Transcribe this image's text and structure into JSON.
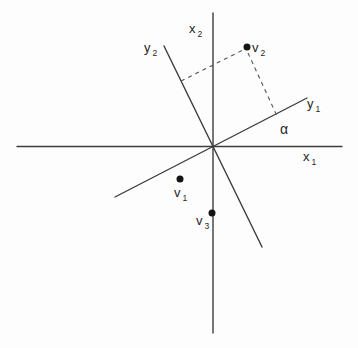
{
  "colors": {
    "background": "#fdfdfd",
    "ink": "#3c3c3c",
    "dash": "#555555",
    "dot": "#141414",
    "text": "#262626"
  },
  "labels": {
    "x1": {
      "base": "x",
      "sub": "1"
    },
    "x2": {
      "base": "x",
      "sub": "2"
    },
    "y1": {
      "base": "y",
      "sub": "1"
    },
    "y2": {
      "base": "y",
      "sub": "2"
    },
    "v1": {
      "base": "v",
      "sub": "1"
    },
    "v2": {
      "base": "v",
      "sub": "2"
    },
    "v3": {
      "base": "v",
      "sub": "3"
    },
    "alpha": "α"
  },
  "diagram": {
    "canvas": {
      "width": 358,
      "height": 348
    },
    "origin": {
      "x": 213,
      "y": 146.5
    },
    "axes": [
      {
        "name": "x1-axis",
        "x1": 17,
        "y1": 146.5,
        "x2": 342,
        "y2": 146.5
      },
      {
        "name": "x2-axis",
        "x1": 213,
        "y1": 13,
        "x2": 213,
        "y2": 333
      },
      {
        "name": "y1-axis",
        "x1": 115,
        "y1": 197,
        "x2": 307,
        "y2": 98
      },
      {
        "name": "y2-axis",
        "x1": 164,
        "y1": 46,
        "x2": 262,
        "y2": 247
      }
    ],
    "dashed_lines": [
      {
        "name": "v2-projection-onto-y2",
        "x1": 181,
        "y1": 81,
        "x2": 243,
        "y2": 50
      },
      {
        "name": "v2-projection-onto-y1",
        "x1": 248,
        "y1": 53,
        "x2": 277,
        "y2": 116
      }
    ],
    "points": [
      {
        "name": "point-v2",
        "x": 247,
        "y": 47,
        "r": 3.5
      },
      {
        "name": "point-v1",
        "x": 180,
        "y": 179,
        "r": 3.5
      },
      {
        "name": "point-v3",
        "x": 212,
        "y": 213,
        "r": 3.5
      }
    ],
    "angle": {
      "name": "alpha",
      "between": [
        "y1-axis",
        "x1-axis"
      ]
    }
  }
}
